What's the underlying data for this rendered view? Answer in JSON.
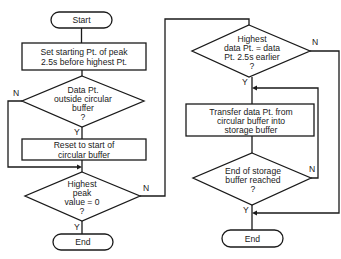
{
  "diagram": {
    "type": "flowchart",
    "nodes": {
      "start": {
        "label": "Start"
      },
      "set_start": {
        "lines": [
          "Set starting Pt. of peak",
          "2.5s before highest Pt."
        ]
      },
      "outside_buffer": {
        "lines": [
          "Data Pt.",
          "outside circular",
          "buffer",
          "?"
        ]
      },
      "reset": {
        "lines": [
          "Reset to start of",
          "circular buffer"
        ]
      },
      "peak_zero": {
        "lines": [
          "Highest",
          "peak",
          "value = 0",
          "?"
        ]
      },
      "end_left": {
        "label": "End"
      },
      "highest_equal": {
        "lines": [
          "Highest",
          "data Pt. = data",
          "Pt. 2.5s earlier",
          "?"
        ]
      },
      "transfer": {
        "lines": [
          "Transfer data Pt. from",
          "circular buffer into",
          "storage buffer"
        ]
      },
      "storage_end": {
        "lines": [
          "End of storage",
          "buffer reached",
          "?"
        ]
      },
      "end_right": {
        "label": "End"
      }
    },
    "edge_labels": {
      "outside_buffer_no": "N",
      "outside_buffer_yes": "Y",
      "peak_zero_no": "N",
      "peak_zero_yes": "Y",
      "highest_equal_no": "N",
      "highest_equal_yes": "Y",
      "storage_end_no": "N",
      "storage_end_yes": "Y"
    }
  }
}
